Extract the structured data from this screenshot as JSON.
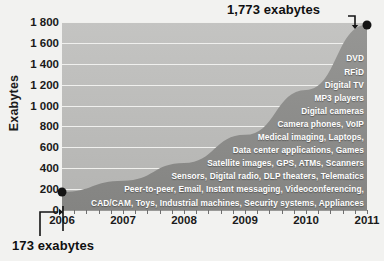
{
  "chart_data": {
    "type": "area",
    "title": "",
    "xlabel": "",
    "ylabel": "Exabytes",
    "x": [
      2006,
      2007,
      2008,
      2009,
      2010,
      2011
    ],
    "xticklabels": [
      "2006",
      "2007",
      "2008",
      "2009",
      "2010",
      "2011"
    ],
    "values": [
      173,
      280,
      450,
      720,
      1150,
      1773
    ],
    "series": [
      {
        "name": "Information created and replicated",
        "values": [
          173,
          280,
          450,
          720,
          1150,
          1773
        ]
      }
    ],
    "ylim": [
      0,
      1800
    ],
    "yticks": [
      0,
      200,
      400,
      600,
      800,
      1000,
      1200,
      1400,
      1600,
      1800
    ],
    "yticklabels": [
      "0",
      "200",
      "400",
      "600",
      "800",
      "1 000",
      "1 200",
      "1 400",
      "1 600",
      "1 800"
    ],
    "grid": true,
    "legend": null,
    "annotations": [
      {
        "label": "1,773 exabytes",
        "x": 2011,
        "y": 1773,
        "position": "top-right"
      },
      {
        "label": "173 exabytes",
        "x": 2006,
        "y": 173,
        "position": "bottom-left"
      }
    ],
    "inline_labels": [
      "DVD",
      "RFiD",
      "Digital TV",
      "MP3 players",
      "Digital cameras",
      "Camera phones, VoIP",
      "Medical imaging, Laptops,",
      "Data center applications, Games",
      "Satellite images, GPS, ATMs, Scanners",
      "Sensors, Digital radio, DLP theaters, Telematics",
      "Peer-to-peer, Email, Instant messaging, Videoconferencing,",
      "CAD/CAM, Toys, Industrial machines, Security systems, Appliances"
    ],
    "colors": {
      "plot_background": "#bcbcba",
      "area_fill": "#8d8d8b",
      "gridline": "#f4f4f2",
      "marker": "#141414",
      "label_text": "#ffffff",
      "axis_text": "#1a1a1a",
      "page_background": "#f2f2f0"
    }
  }
}
